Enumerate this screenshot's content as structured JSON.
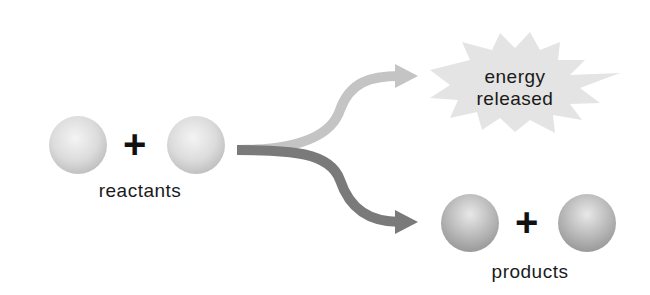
{
  "diagram": {
    "reactants": {
      "label": "reactants",
      "operator": "+"
    },
    "energy": {
      "line1": "energy",
      "line2": "released"
    },
    "products": {
      "label": "products",
      "operator": "+"
    },
    "colors": {
      "sphere_light": "#e6e6e6",
      "sphere_dark": "#a9a9a9",
      "energy_arrow": "#c4c4c4",
      "product_arrow": "#7a7a7a",
      "burst": "#e4e4e4"
    }
  }
}
